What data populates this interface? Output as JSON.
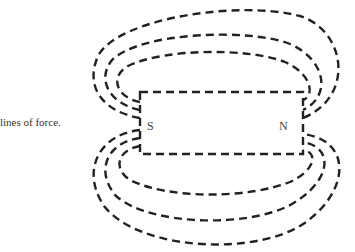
{
  "caption": "lines of force.",
  "magnet": {
    "south_label": "S",
    "north_label": "N"
  },
  "field_lines": {
    "above_count": 3,
    "below_count": 3,
    "style": "dashed"
  },
  "colors": {
    "ink": "#222222",
    "background": "#ffffff"
  }
}
